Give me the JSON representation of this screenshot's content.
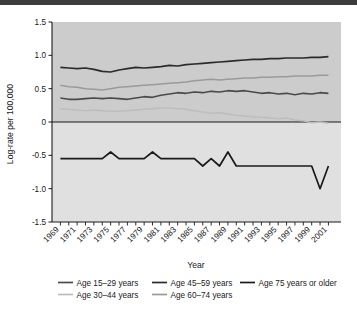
{
  "figure": {
    "background": "#ffffff",
    "plot_band_upper": "#cccccc",
    "plot_band_lower": "#e0e0e0",
    "axis_color": "#1a1a1a",
    "top_rule_color": "#3c3c3c"
  },
  "chart_data": {
    "type": "line",
    "title": "",
    "xlabel": "Year",
    "ylabel": "Log-rate per 100,000",
    "xlim": [
      1968,
      2002.5
    ],
    "ylim": [
      -1.5,
      1.5
    ],
    "grid": false,
    "legend_position": "bottom",
    "yticks": [
      "1.5",
      "1.0",
      "0.5",
      "0",
      "-0.5",
      "-1.0",
      "-1.5"
    ],
    "ytick_values": [
      1.5,
      1.0,
      0.5,
      0,
      -0.5,
      -1.0,
      -1.5
    ],
    "xticks": [
      "1969",
      "1971",
      "1973",
      "1975",
      "1977",
      "1979",
      "1981",
      "1983",
      "1985",
      "1987",
      "1989",
      "1991",
      "1993",
      "1995",
      "1997",
      "1999",
      "2001"
    ],
    "xtick_values": [
      1969,
      1971,
      1973,
      1975,
      1977,
      1979,
      1981,
      1983,
      1985,
      1987,
      1989,
      1991,
      1993,
      1995,
      1997,
      1999,
      2001
    ],
    "x": [
      1969,
      1970,
      1971,
      1972,
      1973,
      1974,
      1975,
      1976,
      1977,
      1978,
      1979,
      1980,
      1981,
      1982,
      1983,
      1984,
      1985,
      1986,
      1987,
      1988,
      1989,
      1990,
      1991,
      1992,
      1993,
      1994,
      1995,
      1996,
      1997,
      1998,
      1999,
      2000,
      2001
    ],
    "series": [
      {
        "name": "Age 15–29 years",
        "color": "#4a4a4a",
        "width": 1.6,
        "values": [
          0.36,
          0.34,
          0.34,
          0.35,
          0.36,
          0.35,
          0.36,
          0.35,
          0.34,
          0.36,
          0.38,
          0.37,
          0.4,
          0.42,
          0.44,
          0.43,
          0.45,
          0.44,
          0.46,
          0.45,
          0.47,
          0.46,
          0.47,
          0.45,
          0.43,
          0.44,
          0.42,
          0.43,
          0.41,
          0.43,
          0.42,
          0.44,
          0.43
        ]
      },
      {
        "name": "Age 30–44 years",
        "color": "#bdbdbd",
        "width": 1.5,
        "values": [
          0.2,
          0.19,
          0.18,
          0.17,
          0.18,
          0.17,
          0.16,
          0.16,
          0.17,
          0.18,
          0.19,
          0.2,
          0.21,
          0.21,
          0.2,
          0.19,
          0.17,
          0.15,
          0.13,
          0.14,
          0.12,
          0.1,
          0.09,
          0.08,
          0.07,
          0.06,
          0.05,
          0.06,
          0.03,
          0.02,
          -0.01,
          0.0,
          -0.02
        ]
      },
      {
        "name": "Age 45–59 years",
        "color": "#2b2b2b",
        "width": 1.7,
        "values": [
          0.82,
          0.81,
          0.8,
          0.81,
          0.79,
          0.76,
          0.75,
          0.78,
          0.8,
          0.82,
          0.81,
          0.82,
          0.83,
          0.85,
          0.84,
          0.86,
          0.87,
          0.88,
          0.89,
          0.9,
          0.91,
          0.92,
          0.93,
          0.94,
          0.94,
          0.95,
          0.95,
          0.96,
          0.96,
          0.96,
          0.97,
          0.97,
          0.98
        ]
      },
      {
        "name": "Age 60–74 years",
        "color": "#9a9a9a",
        "width": 1.5,
        "values": [
          0.55,
          0.53,
          0.52,
          0.5,
          0.49,
          0.48,
          0.5,
          0.52,
          0.53,
          0.54,
          0.55,
          0.56,
          0.57,
          0.58,
          0.59,
          0.6,
          0.62,
          0.63,
          0.64,
          0.63,
          0.64,
          0.65,
          0.66,
          0.66,
          0.67,
          0.67,
          0.68,
          0.68,
          0.69,
          0.69,
          0.69,
          0.7,
          0.7
        ]
      },
      {
        "name": "Age 75 years or older",
        "color": "#1a1a1a",
        "width": 1.7,
        "values": [
          -0.55,
          -0.55,
          -0.55,
          -0.55,
          -0.55,
          -0.55,
          -0.45,
          -0.55,
          -0.55,
          -0.55,
          -0.55,
          -0.45,
          -0.55,
          -0.55,
          -0.55,
          -0.55,
          -0.55,
          -0.66,
          -0.55,
          -0.66,
          -0.45,
          -0.66,
          -0.66,
          -0.66,
          -0.66,
          -0.66,
          -0.66,
          -0.66,
          -0.66,
          -0.66,
          -0.66,
          -1.0,
          -0.66
        ]
      }
    ]
  },
  "legend": {
    "entries": [
      {
        "label": "Age 15–29 years",
        "color": "#4a4a4a"
      },
      {
        "label": "Age 45–59 years",
        "color": "#2b2b2b"
      },
      {
        "label": "Age 75 years or older",
        "color": "#1a1a1a"
      },
      {
        "label": "Age 30–44 years",
        "color": "#bdbdbd"
      },
      {
        "label": "Age 60–74 years",
        "color": "#9a9a9a"
      }
    ]
  }
}
